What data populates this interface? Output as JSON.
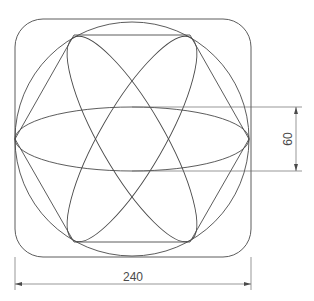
{
  "drawing": {
    "title": "",
    "shapes": [
      "rounded-square",
      "circle",
      "hexagon",
      "three-ellipses"
    ],
    "dimensions": {
      "width_label": "240",
      "ellipse_minor_label": "60"
    },
    "colors": {
      "line": "#4a4a4a",
      "background": "#ffffff"
    }
  }
}
